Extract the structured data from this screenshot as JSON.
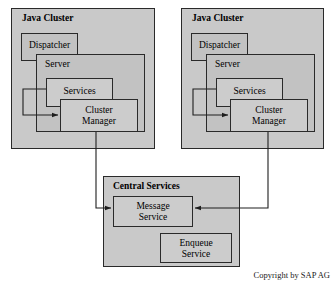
{
  "diagram": {
    "copyright": "Copyright by SAP AG",
    "colors": {
      "cluster_fill": "#c9c9c9",
      "server_fill": "#c2c2c2",
      "leaf_fill": "#cccccc",
      "stroke": "#2a2a2a",
      "background": "#ffffff"
    },
    "clusters": [
      {
        "id": "java-cluster-left",
        "title": "Java Cluster",
        "dispatcher": "Dispatcher",
        "server": "Server",
        "services": "Services",
        "cluster_manager_line1": "Cluster",
        "cluster_manager_line2": "Manager"
      },
      {
        "id": "java-cluster-right",
        "title": "Java Cluster",
        "dispatcher": "Dispatcher",
        "server": "Server",
        "services": "Services",
        "cluster_manager_line1": "Cluster",
        "cluster_manager_line2": "Manager"
      }
    ],
    "central": {
      "title": "Central Services",
      "message_service_line1": "Message",
      "message_service_line2": "Service",
      "enqueue_service_line1": "Enqueue",
      "enqueue_service_line2": "Service"
    },
    "connectors": [
      {
        "id": "left-services-to-cluster-manager",
        "from": "Services",
        "to": "Cluster Manager",
        "arrow": "to"
      },
      {
        "id": "right-services-to-cluster-manager",
        "from": "Services",
        "to": "Cluster Manager",
        "arrow": "to"
      },
      {
        "id": "left-cluster-manager-to-message-service",
        "from": "Cluster Manager",
        "to": "Message Service",
        "arrow": "to"
      },
      {
        "id": "right-cluster-manager-to-message-service",
        "from": "Cluster Manager",
        "to": "Message Service",
        "arrow": "to"
      }
    ]
  }
}
